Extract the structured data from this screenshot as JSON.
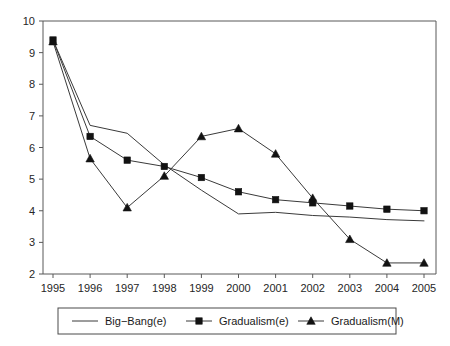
{
  "chart_data": {
    "type": "line",
    "title": "",
    "subtitle": "",
    "xlabel": "",
    "ylabel": "",
    "categories": [
      "1995",
      "1996",
      "1997",
      "1998",
      "1999",
      "2000",
      "2001",
      "2002",
      "2003",
      "2004",
      "2005"
    ],
    "x": [
      1995,
      1996,
      1997,
      1998,
      1999,
      2000,
      2001,
      2002,
      2003,
      2004,
      2005
    ],
    "xlim": [
      1995,
      2005
    ],
    "ylim": [
      2,
      10
    ],
    "yticks": [
      2,
      3,
      4,
      5,
      6,
      7,
      8,
      9,
      10
    ],
    "ytick_labels": [
      "2",
      "3",
      "4",
      "5",
      "6",
      "7",
      "8",
      "9",
      "10"
    ],
    "xticks": [
      1995,
      1996,
      1997,
      1998,
      1999,
      2000,
      2001,
      2002,
      2003,
      2004,
      2005
    ],
    "xtick_labels": [
      "1995",
      "1996",
      "1997",
      "1998",
      "1999",
      "2000",
      "2001",
      "2002",
      "2003",
      "2004",
      "2005"
    ],
    "grid": false,
    "legend_position": "bottom",
    "series": [
      {
        "name": "Big−Bang(e)",
        "marker": "none",
        "color": "#3a3a3a",
        "values": [
          9.4,
          6.7,
          6.45,
          5.45,
          4.65,
          3.9,
          3.95,
          3.85,
          3.8,
          3.72,
          3.68
        ]
      },
      {
        "name": "Gradualism(e)",
        "marker": "square",
        "color": "#121212",
        "values": [
          9.4,
          6.35,
          5.6,
          5.4,
          5.05,
          4.6,
          4.35,
          4.25,
          4.15,
          4.05,
          4.0
        ]
      },
      {
        "name": "Gradualism(M)",
        "marker": "triangle",
        "color": "#121212",
        "values": [
          9.35,
          5.65,
          4.1,
          5.1,
          6.35,
          6.6,
          5.8,
          4.4,
          3.1,
          2.35,
          2.35
        ]
      }
    ]
  },
  "legend": {
    "entries": [
      {
        "label": "Big−Bang(e)",
        "marker": "none"
      },
      {
        "label": "Gradualism(e)",
        "marker": "square"
      },
      {
        "label": "Gradualism(M)",
        "marker": "triangle"
      }
    ]
  },
  "axes": {
    "y_labels": [
      "10",
      "9",
      "8",
      "7",
      "6",
      "5",
      "4",
      "3",
      "2"
    ],
    "x_labels": [
      "1995",
      "1996",
      "1997",
      "1998",
      "1999",
      "2000",
      "2001",
      "2002",
      "2003",
      "2004",
      "2005"
    ]
  }
}
